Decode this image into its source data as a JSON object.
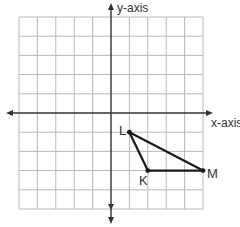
{
  "diagram": {
    "type": "coordinate-plane",
    "axes": {
      "x_label": "x-axis",
      "y_label": "y-axis",
      "x_range": [
        -5,
        5
      ],
      "y_range": [
        -5,
        5
      ],
      "grid": true
    },
    "triangle": {
      "name": "KLM",
      "points": [
        {
          "label": "L",
          "x": 1,
          "y": -1
        },
        {
          "label": "K",
          "x": 2,
          "y": -3
        },
        {
          "label": "M",
          "x": 5,
          "y": -3
        }
      ]
    },
    "colors": {
      "grid": "#b8b8b8",
      "axis": "#333333",
      "triangle": "#1a1a1a"
    }
  }
}
